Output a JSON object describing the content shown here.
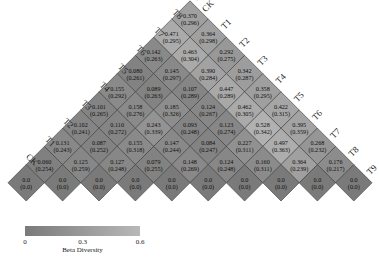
{
  "chart_data": {
    "type": "heatmap",
    "subtype": "triangular-rotated",
    "title": "",
    "labels": [
      "CK",
      "T1",
      "T2",
      "T3",
      "T4",
      "T5",
      "T6",
      "T7",
      "T8",
      "T9"
    ],
    "left_labels_bottom_to_top": [
      "CK",
      "T1",
      "T2",
      "T3",
      "T4",
      "T5",
      "T6",
      "T7",
      "T8",
      "T9"
    ],
    "right_labels_top_to_bottom": [
      "CK",
      "T1",
      "T2",
      "T3",
      "T4",
      "T5",
      "T6",
      "T7",
      "T8",
      "T9"
    ],
    "rows_top_to_bottom": [
      [
        {
          "v": "0.370",
          "s": "(0.296)"
        }
      ],
      [
        {
          "v": "0.471",
          "s": "(0.295)"
        },
        {
          "v": "0.364",
          "s": "(0.298)"
        }
      ],
      [
        {
          "v": "0.142",
          "s": "(0.263)"
        },
        {
          "v": "0.463",
          "s": "(0.304)"
        },
        {
          "v": "0.292",
          "s": "(0.275)"
        }
      ],
      [
        {
          "v": "0.080",
          "s": "(0.261)"
        },
        {
          "v": "0.145",
          "s": "(0.297)"
        },
        {
          "v": "0.390",
          "s": "(0.284)"
        },
        {
          "v": "0.342",
          "s": "(0.287)"
        }
      ],
      [
        {
          "v": "0.155",
          "s": "(0.292)"
        },
        {
          "v": "0.089",
          "s": "(0.263)"
        },
        {
          "v": "0.107",
          "s": "(0.289)"
        },
        {
          "v": "0.447",
          "s": "(0.289)"
        },
        {
          "v": "0.358",
          "s": "(0.295)"
        }
      ],
      [
        {
          "v": "0.101",
          "s": "(0.265)"
        },
        {
          "v": "0.158",
          "s": "(0.276)"
        },
        {
          "v": "0.185",
          "s": "(0.326)"
        },
        {
          "v": "0.124",
          "s": "(0.267)"
        },
        {
          "v": "0.462",
          "s": "(0.305)"
        },
        {
          "v": "0.422",
          "s": "(0.315)"
        }
      ],
      [
        {
          "v": "0.102",
          "s": "(0.241)"
        },
        {
          "v": "0.110",
          "s": "(0.272)"
        },
        {
          "v": "0.243",
          "s": "(0.339)"
        },
        {
          "v": "0.093",
          "s": "(0.248)"
        },
        {
          "v": "0.123",
          "s": "(0.274)"
        },
        {
          "v": "0.528",
          "s": "(0.342)"
        },
        {
          "v": "0.395",
          "s": "(0.359)"
        }
      ],
      [
        {
          "v": "0.131",
          "s": "(0.243)"
        },
        {
          "v": "0.087",
          "s": "(0.252)"
        },
        {
          "v": "0.155",
          "s": "(0.318)"
        },
        {
          "v": "0.147",
          "s": "(0.244)"
        },
        {
          "v": "0.084",
          "s": "(0.247)"
        },
        {
          "v": "0.227",
          "s": "(0.311)"
        },
        {
          "v": "0.497",
          "s": "(0.363)"
        },
        {
          "v": "0.268",
          "s": "(0.232)"
        }
      ],
      [
        {
          "v": "0.060",
          "s": "(0.254)"
        },
        {
          "v": "0.125",
          "s": "(0.259)"
        },
        {
          "v": "0.127",
          "s": "(0.248)"
        },
        {
          "v": "0.079",
          "s": "(0.255)"
        },
        {
          "v": "0.148",
          "s": "(0.269)"
        },
        {
          "v": "0.124",
          "s": "(0.248)"
        },
        {
          "v": "0.160",
          "s": "(0.311)"
        },
        {
          "v": "0.364",
          "s": "(0.239)"
        },
        {
          "v": "0.176",
          "s": "(0.217)"
        }
      ],
      [
        {
          "v": "0.0",
          "s": "(0.0)"
        },
        {
          "v": "0.0",
          "s": "(0.0)"
        },
        {
          "v": "0.0",
          "s": "(0.0)"
        },
        {
          "v": "0.0",
          "s": "(0.0)"
        },
        {
          "v": "0.0",
          "s": "(0.0)"
        },
        {
          "v": "0.0",
          "s": "(0.0)"
        },
        {
          "v": "0.0",
          "s": "(0.0)"
        },
        {
          "v": "0.0",
          "s": "(0.0)"
        },
        {
          "v": "0.0",
          "s": "(0.0)"
        },
        {
          "v": "0.0",
          "s": "(0.0)"
        }
      ]
    ],
    "colorbar": {
      "label": "Beta Diversity",
      "ticks": [
        "0",
        "0.3",
        "0.6"
      ],
      "range": [
        0,
        0.6
      ],
      "color_low": "#7a7a7a",
      "color_high": "#b8b8b8"
    },
    "grid": false
  }
}
